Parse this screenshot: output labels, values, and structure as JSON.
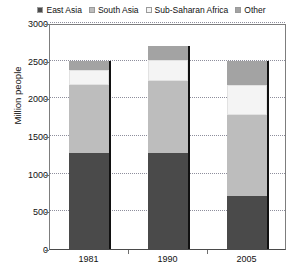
{
  "chart_data": {
    "type": "bar",
    "stacked": true,
    "title": "",
    "xlabel": "",
    "ylabel": "Million people",
    "ylim": [
      0,
      3000
    ],
    "ytick_step": 500,
    "yticks": [
      3000,
      2500,
      2000,
      1500,
      1000,
      500,
      0
    ],
    "grid": true,
    "grid_axis": "y",
    "legend_position": "top",
    "categories": [
      "1981",
      "1990",
      "2005"
    ],
    "series": [
      {
        "name": "East Asia",
        "color": "#4a4a4a",
        "values": [
          1280,
          1280,
          700
        ]
      },
      {
        "name": "South Asia",
        "color": "#bdbdbd",
        "values": [
          900,
          950,
          1080
        ]
      },
      {
        "name": "Sub-Saharan Africa",
        "color": "#f4f4f4",
        "values": [
          200,
          280,
          400
        ]
      },
      {
        "name": "Other",
        "color": "#a3a3a3",
        "values": [
          120,
          190,
          320
        ]
      }
    ],
    "totals": [
      2500,
      2700,
      2500
    ]
  },
  "legend": {
    "items": [
      {
        "label": "East Asia",
        "color": "#4a4a4a"
      },
      {
        "label": "South Asia",
        "color": "#bdbdbd"
      },
      {
        "label": "Sub-Saharan Africa",
        "color": "#f4f4f4"
      },
      {
        "label": "Other",
        "color": "#a3a3a3"
      }
    ]
  },
  "axes": {
    "y_title": "Million people",
    "y_labels": [
      "3000",
      "2500",
      "2000",
      "1500",
      "1000",
      "500",
      "0"
    ],
    "x_labels": [
      "1981",
      "1990",
      "2005"
    ]
  }
}
